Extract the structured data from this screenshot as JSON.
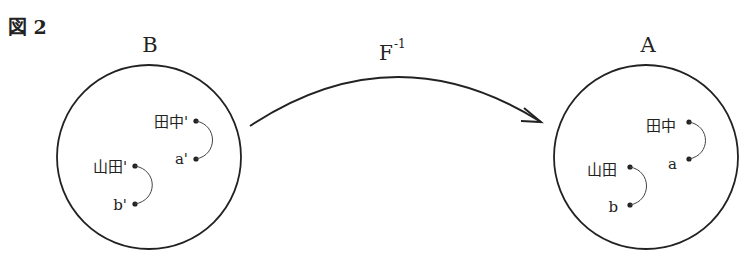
{
  "figure": {
    "title": "図 2",
    "mapping": {
      "base": "F",
      "superscript": "-1",
      "direction": "B → A"
    },
    "sets": [
      {
        "id": "B",
        "label": "B",
        "pairs": [
          {
            "top": "田中'",
            "bottom": "a'"
          },
          {
            "top": "山田'",
            "bottom": "b'"
          }
        ]
      },
      {
        "id": "A",
        "label": "A",
        "pairs": [
          {
            "top": "田中",
            "bottom": "a"
          },
          {
            "top": "山田",
            "bottom": "b"
          }
        ]
      }
    ],
    "colors": {
      "stroke": "#222222",
      "background": "#ffffff"
    }
  }
}
